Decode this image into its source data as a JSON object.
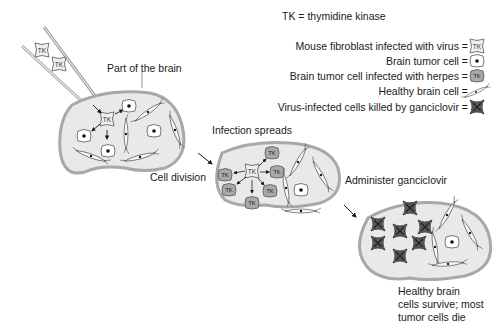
{
  "legend": {
    "definition": "TK = thymidine kinase",
    "items": [
      {
        "label": "Mouse fibroblast infected with virus =",
        "icon": "fibroblast-tk-icon"
      },
      {
        "label": "Brain tumor cell =",
        "icon": "tumor-cell-icon"
      },
      {
        "label": "Brain tumor cell infected with herpes =",
        "icon": "infected-tumor-cell-icon"
      },
      {
        "label": "Healthy brain cell =",
        "icon": "healthy-brain-cell-icon"
      },
      {
        "label": "Virus-infected cells killed by ganciclovir =",
        "icon": "killed-cell-icon"
      }
    ]
  },
  "stages": {
    "brain": {
      "label": "Part of the brain"
    },
    "division": {
      "label": "Cell division"
    },
    "spread": {
      "label": "Infection spreads"
    },
    "administer": {
      "label": "Administer ganciclovir"
    },
    "outcome": {
      "line1": "Healthy brain",
      "line2": "cells survive; most",
      "line3": "tumor cells die"
    }
  },
  "glyph": {
    "tk": "TK"
  },
  "colors": {
    "tissue_fill": "#e9e9e9",
    "tissue_border": "#a8a8a8",
    "infected_fill": "#a9a9a9",
    "killed_fill": "#5a5a5a",
    "text": "#1a1a1a"
  }
}
